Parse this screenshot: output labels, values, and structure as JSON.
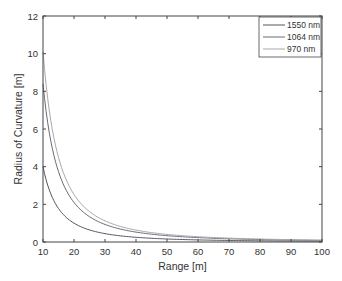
{
  "chart_data": {
    "type": "line",
    "title": "",
    "xlabel": "Range [m]",
    "ylabel": "Radius of Curvature [m]",
    "xlim": [
      10,
      100
    ],
    "ylim": [
      0,
      12
    ],
    "xticks": [
      10,
      20,
      30,
      40,
      50,
      60,
      70,
      80,
      90,
      100
    ],
    "yticks": [
      0,
      2,
      4,
      6,
      8,
      10,
      12
    ],
    "grid": false,
    "legend_position": "upper right",
    "x": [
      10,
      12,
      15,
      20,
      25,
      30,
      40,
      50,
      60,
      70,
      80,
      90,
      100
    ],
    "series": [
      {
        "name": "1550 nm",
        "color": "#555566",
        "values": [
          4.0,
          2.78,
          1.78,
          1.0,
          0.64,
          0.44,
          0.25,
          0.16,
          0.11,
          0.08,
          0.06,
          0.05,
          0.04
        ]
      },
      {
        "name": "1064 nm",
        "color": "#6a6a78",
        "values": [
          8.4,
          5.83,
          3.73,
          2.1,
          1.34,
          0.93,
          0.53,
          0.34,
          0.23,
          0.17,
          0.13,
          0.1,
          0.08
        ]
      },
      {
        "name": "970 nm",
        "color": "#a8a8a8",
        "values": [
          10.1,
          7.01,
          4.49,
          2.53,
          1.62,
          1.12,
          0.63,
          0.4,
          0.28,
          0.21,
          0.16,
          0.12,
          0.1
        ]
      }
    ]
  }
}
